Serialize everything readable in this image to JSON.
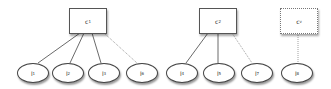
{
  "diagram": {
    "clusters": [
      {
        "id": "c1",
        "label": "c",
        "sub": "1",
        "style": "solid",
        "x": 69,
        "y": 8
      },
      {
        "id": "c2",
        "label": "c",
        "sub": "2",
        "style": "solid",
        "x": 199,
        "y": 8
      },
      {
        "id": "cv",
        "label": "c",
        "sub": "v",
        "style": "dotted",
        "x": 280,
        "y": 8
      }
    ],
    "leaves": [
      {
        "id": "l1",
        "label": "l",
        "sub": "1",
        "x": 17,
        "y": 63
      },
      {
        "id": "l2",
        "label": "l",
        "sub": "2",
        "x": 52,
        "y": 63
      },
      {
        "id": "l3",
        "label": "l",
        "sub": "3",
        "x": 88,
        "y": 63
      },
      {
        "id": "l6",
        "label": "l",
        "sub": "6",
        "x": 126,
        "y": 63
      },
      {
        "id": "l4",
        "label": "l",
        "sub": "4",
        "x": 166,
        "y": 63
      },
      {
        "id": "l5",
        "label": "l",
        "sub": "5",
        "x": 203,
        "y": 63
      },
      {
        "id": "l7",
        "label": "l",
        "sub": "7",
        "x": 241,
        "y": 63
      },
      {
        "id": "l8",
        "label": "l",
        "sub": "8",
        "x": 281,
        "y": 63
      }
    ],
    "edges": [
      {
        "from": "c1",
        "to": "l1",
        "style": "solid"
      },
      {
        "from": "c1",
        "to": "l2",
        "style": "solid"
      },
      {
        "from": "c1",
        "to": "l3",
        "style": "solid"
      },
      {
        "from": "c1",
        "to": "l6",
        "style": "dotted"
      },
      {
        "from": "c2",
        "to": "l4",
        "style": "solid"
      },
      {
        "from": "c2",
        "to": "l5",
        "style": "solid"
      },
      {
        "from": "c2",
        "to": "l7",
        "style": "dotted"
      },
      {
        "from": "cv",
        "to": "l8",
        "style": "dotted"
      }
    ]
  }
}
